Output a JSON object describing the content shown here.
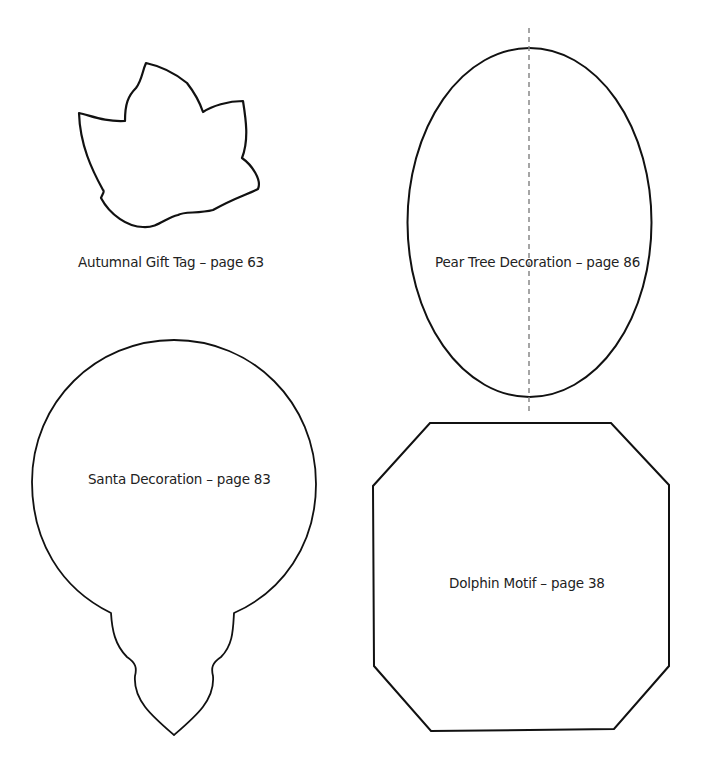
{
  "colors": {
    "stroke": "#111111",
    "dash": "#888888",
    "text": "#222222",
    "background": "#ffffff"
  },
  "templates": [
    {
      "id": "leaf",
      "label": "Autumnal Gift Tag – page 63"
    },
    {
      "id": "oval",
      "label": "Pear Tree Decoration – page 86"
    },
    {
      "id": "bauble",
      "label": "Santa Decoration – page 83"
    },
    {
      "id": "octagon",
      "label": "Dolphin Motif – page 38"
    }
  ]
}
